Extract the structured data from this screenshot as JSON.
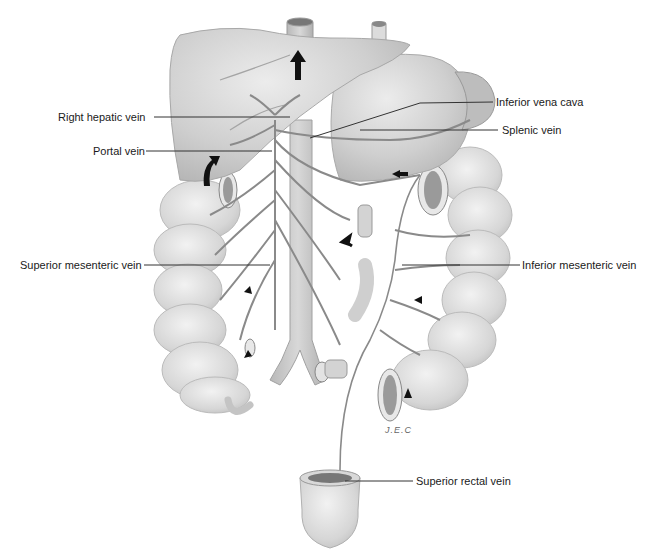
{
  "figure": {
    "labels": {
      "right_hepatic_vein": "Right hepatic vein",
      "portal_vein": "Portal vein",
      "inferior_vena_cava": "Inferior vena cava",
      "splenic_vein": "Splenic vein",
      "superior_mesenteric_vein": "Superior mesenteric vein",
      "inferior_mesenteric_vein": "Inferior mesenteric vein",
      "superior_rectal_vein": "Superior rectal vein"
    },
    "signature": "J.E.C",
    "colors": {
      "organ_fill": "#cfcfcf",
      "organ_light": "#e4e4e4",
      "vein": "#8a8a8a",
      "arrow": "#111111",
      "leader_line": "#333333"
    }
  }
}
